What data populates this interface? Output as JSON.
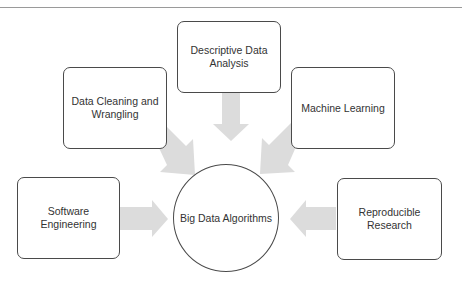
{
  "diagram": {
    "center": {
      "label": "Big Data Algorithms"
    },
    "nodes": [
      {
        "id": "descriptive",
        "label": "Descriptive Data Analysis",
        "line1": "Descriptive Data",
        "line2": "Analysis"
      },
      {
        "id": "cleaning",
        "label": "Data Cleaning and Wrangling",
        "line1": "Data Cleaning and",
        "line2": "Wrangling"
      },
      {
        "id": "ml",
        "label": "Machine Learning",
        "line1": "Machine Learning",
        "line2": ""
      },
      {
        "id": "software",
        "label": "Software Engineering",
        "line1": "Software",
        "line2": "Engineering"
      },
      {
        "id": "reproducible",
        "label": "Reproducible Research",
        "line1": "Reproducible",
        "line2": "Research"
      }
    ],
    "colors": {
      "arrow": "#dcdcdc",
      "border": "#4a4a4a",
      "text": "#333333",
      "rule": "#9a9a9a"
    }
  }
}
